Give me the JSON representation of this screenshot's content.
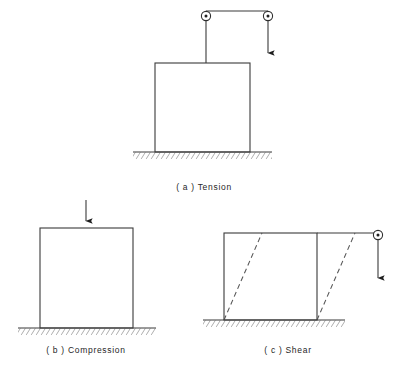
{
  "figure": {
    "background_color": "#ffffff",
    "line_color": "#3a3a3a",
    "dashed_color": "#555555",
    "ground_color": "#4a4a4a",
    "text_color": "#262626"
  },
  "panels": [
    {
      "id": "a",
      "caption": "( a ) Tension",
      "caption_x": 204,
      "caption_y": 190,
      "load_type": "tension",
      "box": {
        "x": 155,
        "y": 63,
        "width": 95,
        "height": 89
      },
      "ground": {
        "x1": 133,
        "x2": 272,
        "y": 152
      },
      "pulleys": [
        {
          "name": "left-pulley",
          "cx": 206,
          "cy": 16,
          "r": 4.6
        },
        {
          "name": "right-pulley",
          "cx": 268,
          "cy": 16,
          "r": 4.6
        }
      ],
      "rope": {
        "horizontal": {
          "x1": 206,
          "x2": 268,
          "y": 11
        },
        "left_drop": {
          "x": 206,
          "y1": 16,
          "y2": 63
        },
        "right_drop": {
          "x": 268,
          "y1": 16,
          "y2": 60
        }
      },
      "arrow": {
        "x": 268,
        "y_tip": 60,
        "direction": "down"
      }
    },
    {
      "id": "b",
      "caption": "( b ) Compression",
      "caption_x": 86,
      "caption_y": 353,
      "load_type": "compression",
      "box": {
        "x": 40,
        "y": 228,
        "width": 93,
        "height": 100
      },
      "ground": {
        "x1": 18,
        "x2": 156,
        "y": 328
      },
      "arrow": {
        "x": 86,
        "y_start": 200,
        "y_tip": 228,
        "direction": "down"
      }
    },
    {
      "id": "c",
      "caption": "( c ) Shear",
      "caption_x": 288,
      "caption_y": 353,
      "load_type": "shear",
      "box": {
        "x": 224,
        "y": 233,
        "width": 93,
        "height": 87
      },
      "ground": {
        "x1": 203,
        "x2": 345,
        "y": 320
      },
      "deformed_shape": {
        "style": "dashed",
        "lines": [
          {
            "x1": 224,
            "y1": 320,
            "x2": 262,
            "y2": 233
          },
          {
            "x1": 317,
            "y1": 320,
            "x2": 355,
            "y2": 233
          }
        ]
      },
      "top_extension": {
        "x1": 317,
        "x2": 378,
        "y": 233
      },
      "pulleys": [
        {
          "name": "shear-pulley",
          "cx": 378,
          "cy": 235,
          "r": 4.6
        }
      ],
      "arrow": {
        "x": 378,
        "y_start": 240,
        "y_tip": 285,
        "direction": "down"
      }
    }
  ]
}
